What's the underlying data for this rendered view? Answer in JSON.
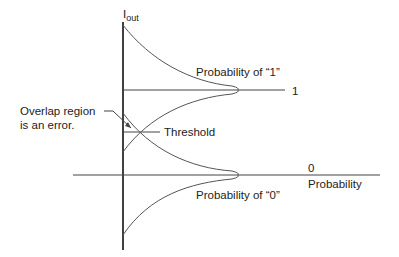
{
  "diagram": {
    "axis_label_main": "I",
    "axis_label_sub": "out",
    "level_one_label": "1",
    "level_zero_label": "0",
    "x_axis_label": "Probability",
    "curve_one_label": "Probability of “1”",
    "curve_zero_label": "Probability of “0”",
    "threshold_label": "Threshold",
    "overlap_line1": "Overlap region",
    "overlap_line2": "is an error.",
    "colors": {
      "line": "#333333",
      "axis": "#111111",
      "text": "#222222",
      "background": "#ffffff"
    }
  }
}
